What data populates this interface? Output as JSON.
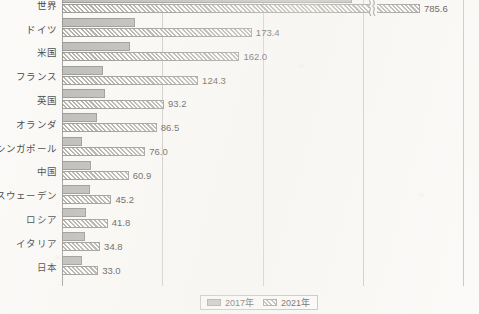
{
  "chart_data": {
    "type": "bar",
    "orientation": "horizontal",
    "title": "",
    "xlabel": "",
    "ylabel": "",
    "grid": true,
    "legend_position": "bottom",
    "axis_break": {
      "present": true,
      "on_category": "世界",
      "symbol": "squiggle"
    },
    "xlim": [
      0,
      380
    ],
    "gridline_values": [
      91,
      183,
      274,
      365
    ],
    "categories": [
      "世界",
      "ドイツ",
      "米国",
      "フランス",
      "英国",
      "オランダ",
      "シンガポール",
      "中国",
      "スウェーデン",
      "ロシア",
      "イタリア",
      "日本"
    ],
    "series": [
      {
        "name": "2017年",
        "pattern": "solid-gray",
        "color": "#b7b7b4",
        "values": [
          null,
          67.0,
          62.0,
          37.5,
          39.0,
          32.0,
          18.0,
          26.5,
          25.5,
          22.0,
          21.0,
          18.5
        ]
      },
      {
        "name": "2021年",
        "pattern": "hatched",
        "color": "#a8a8a5",
        "values": [
          785.6,
          173.4,
          162.0,
          124.3,
          93.2,
          86.5,
          76.0,
          60.9,
          45.2,
          41.8,
          34.8,
          33.0
        ]
      }
    ],
    "value_labels": [
      "785.6",
      "173.4",
      "162.0",
      "124.3",
      "93.2",
      "86.5",
      "76.0",
      "60.9",
      "45.2",
      "41.8",
      "34.8",
      "33.0"
    ]
  },
  "legend": {
    "items": [
      {
        "label": "2017年",
        "pattern": "solid"
      },
      {
        "label": "2021年",
        "pattern": "hatch"
      }
    ]
  }
}
